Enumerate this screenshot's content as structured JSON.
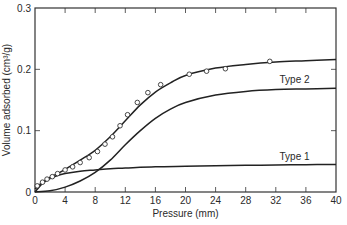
{
  "chart_data": {
    "type": "line",
    "title": "",
    "xlabel": "Pressure (mm)",
    "ylabel": "Volume adsorbed (cm³/g)",
    "xlim": [
      0,
      40
    ],
    "ylim": [
      0,
      0.3
    ],
    "grid": false,
    "x_ticks": [
      0,
      4,
      8,
      12,
      16,
      20,
      24,
      28,
      32,
      36,
      40
    ],
    "x_tick_labels": [
      "0",
      "4",
      "8",
      "12",
      "16",
      "20",
      "24",
      "28",
      "32",
      "36",
      "40"
    ],
    "y_ticks": [
      0,
      0.1,
      0.2,
      0.3
    ],
    "y_tick_labels": [
      "0",
      "0.1",
      "0.2",
      "0.3"
    ],
    "series": [
      {
        "name": "Type 1",
        "label": "Type 1",
        "marker": "none",
        "x": [
          0,
          1,
          2,
          3,
          4,
          6,
          8,
          10,
          12,
          16,
          20,
          24,
          28,
          32,
          36,
          40
        ],
        "y": [
          0,
          0.014,
          0.022,
          0.027,
          0.03,
          0.034,
          0.036,
          0.038,
          0.039,
          0.041,
          0.042,
          0.043,
          0.0435,
          0.044,
          0.0445,
          0.045
        ]
      },
      {
        "name": "Type 2",
        "label": "Type 2",
        "marker": "none",
        "x": [
          0,
          2,
          4,
          6,
          8,
          10,
          12,
          14,
          16,
          18,
          20,
          24,
          28,
          32,
          36,
          40
        ],
        "y": [
          0,
          0.002,
          0.008,
          0.018,
          0.032,
          0.052,
          0.077,
          0.1,
          0.12,
          0.135,
          0.146,
          0.158,
          0.164,
          0.167,
          0.168,
          0.169
        ]
      },
      {
        "name": "Total (observed)",
        "label": "",
        "marker": "none",
        "x": [
          0,
          1,
          2,
          3,
          4,
          6,
          8,
          10,
          12,
          14,
          16,
          18,
          20,
          24,
          28,
          32,
          36,
          40
        ],
        "y": [
          0.005,
          0.016,
          0.024,
          0.03,
          0.037,
          0.052,
          0.068,
          0.09,
          0.116,
          0.142,
          0.163,
          0.178,
          0.19,
          0.202,
          0.208,
          0.212,
          0.214,
          0.216
        ]
      },
      {
        "name": "Observed points",
        "label": "",
        "marker": "circle",
        "x": [
          0.3,
          1.0,
          1.6,
          2.3,
          3.0,
          4.0,
          5.0,
          6.0,
          7.2,
          8.3,
          9.3,
          10.3,
          11.3,
          12.3,
          13.6,
          15.0,
          16.7,
          20.5,
          22.8,
          25.3,
          31.2
        ],
        "y": [
          0.01,
          0.016,
          0.021,
          0.025,
          0.03,
          0.036,
          0.041,
          0.048,
          0.056,
          0.066,
          0.078,
          0.09,
          0.108,
          0.126,
          0.146,
          0.162,
          0.175,
          0.192,
          0.197,
          0.201,
          0.213
        ]
      }
    ]
  }
}
